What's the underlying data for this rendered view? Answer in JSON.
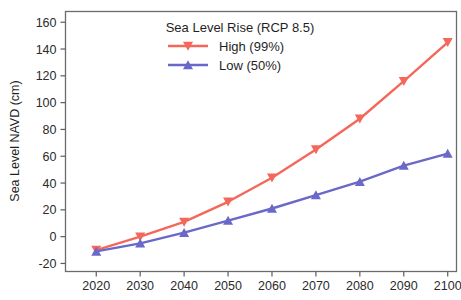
{
  "chart_data": {
    "type": "line",
    "title": "",
    "legend_title": "Sea Level Rise (RCP 8.5)",
    "legend_position": "top-center-inside",
    "xlabel": "",
    "ylabel": "Sea Level NAVD (cm)",
    "x": [
      2020,
      2030,
      2040,
      2050,
      2060,
      2070,
      2080,
      2090,
      2100
    ],
    "xlim": [
      2013,
      2102
    ],
    "ylim": [
      -26,
      168
    ],
    "xticks": [
      2020,
      2030,
      2040,
      2050,
      2060,
      2070,
      2080,
      2090,
      2100
    ],
    "yticks": [
      -20,
      0,
      20,
      40,
      60,
      80,
      100,
      120,
      140,
      160
    ],
    "xticklabels": [
      "2020",
      "2030",
      "2040",
      "2050",
      "2060",
      "2070",
      "2080",
      "2090",
      "2100"
    ],
    "yticklabels": [
      "-20",
      "0",
      "20",
      "40",
      "60",
      "80",
      "100",
      "120",
      "140",
      "160"
    ],
    "grid": false,
    "series": [
      {
        "name": "High  (99%)",
        "color": "#f4675a",
        "marker": "triangle-down",
        "values": [
          -10,
          0,
          11,
          26,
          44,
          65,
          88,
          116,
          145
        ]
      },
      {
        "name": "Low  (50%)",
        "color": "#6a68c8",
        "marker": "triangle-up",
        "values": [
          -11,
          -5,
          3,
          12,
          21,
          31,
          41,
          53,
          62
        ]
      }
    ]
  },
  "colors": {
    "high": "#f4675a",
    "low": "#6a68c8",
    "axis": "#5c5c5c",
    "text": "#1f1f1f",
    "background": "#ffffff"
  }
}
